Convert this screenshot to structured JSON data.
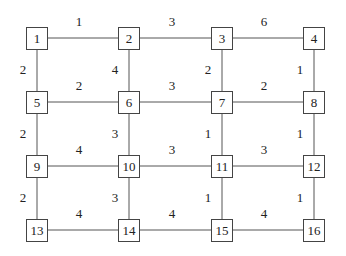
{
  "diagram": {
    "type": "weighted-grid-graph",
    "nodes": [
      {
        "id": "1",
        "x": 37,
        "y": 38
      },
      {
        "id": "2",
        "x": 129,
        "y": 38
      },
      {
        "id": "3",
        "x": 222,
        "y": 38
      },
      {
        "id": "4",
        "x": 314,
        "y": 38
      },
      {
        "id": "5",
        "x": 37,
        "y": 102
      },
      {
        "id": "6",
        "x": 129,
        "y": 102
      },
      {
        "id": "7",
        "x": 222,
        "y": 102
      },
      {
        "id": "8",
        "x": 314,
        "y": 102
      },
      {
        "id": "9",
        "x": 37,
        "y": 166
      },
      {
        "id": "10",
        "x": 129,
        "y": 166
      },
      {
        "id": "11",
        "x": 222,
        "y": 166
      },
      {
        "id": "12",
        "x": 314,
        "y": 166
      },
      {
        "id": "13",
        "x": 37,
        "y": 230
      },
      {
        "id": "14",
        "x": 129,
        "y": 230
      },
      {
        "id": "15",
        "x": 222,
        "y": 230
      },
      {
        "id": "16",
        "x": 314,
        "y": 230
      }
    ],
    "edges": [
      {
        "from": "1",
        "to": "2",
        "weight": "1",
        "lx": 79,
        "ly": 22
      },
      {
        "from": "2",
        "to": "3",
        "weight": "3",
        "lx": 172,
        "ly": 22
      },
      {
        "from": "3",
        "to": "4",
        "weight": "6",
        "lx": 264,
        "ly": 22
      },
      {
        "from": "5",
        "to": "6",
        "weight": "2",
        "lx": 79,
        "ly": 86
      },
      {
        "from": "6",
        "to": "7",
        "weight": "3",
        "lx": 172,
        "ly": 86
      },
      {
        "from": "7",
        "to": "8",
        "weight": "2",
        "lx": 264,
        "ly": 86
      },
      {
        "from": "9",
        "to": "10",
        "weight": "4",
        "lx": 79,
        "ly": 150
      },
      {
        "from": "10",
        "to": "11",
        "weight": "3",
        "lx": 172,
        "ly": 150
      },
      {
        "from": "11",
        "to": "12",
        "weight": "3",
        "lx": 264,
        "ly": 150
      },
      {
        "from": "13",
        "to": "14",
        "weight": "4",
        "lx": 79,
        "ly": 214
      },
      {
        "from": "14",
        "to": "15",
        "weight": "4",
        "lx": 172,
        "ly": 214
      },
      {
        "from": "15",
        "to": "16",
        "weight": "4",
        "lx": 264,
        "ly": 214
      },
      {
        "from": "1",
        "to": "5",
        "weight": "2",
        "lx": 23,
        "ly": 70
      },
      {
        "from": "2",
        "to": "6",
        "weight": "4",
        "lx": 115,
        "ly": 70
      },
      {
        "from": "3",
        "to": "7",
        "weight": "2",
        "lx": 208,
        "ly": 70
      },
      {
        "from": "4",
        "to": "8",
        "weight": "1",
        "lx": 300,
        "ly": 70
      },
      {
        "from": "5",
        "to": "9",
        "weight": "2",
        "lx": 23,
        "ly": 134
      },
      {
        "from": "6",
        "to": "10",
        "weight": "3",
        "lx": 115,
        "ly": 134
      },
      {
        "from": "7",
        "to": "11",
        "weight": "1",
        "lx": 208,
        "ly": 134
      },
      {
        "from": "8",
        "to": "12",
        "weight": "1",
        "lx": 300,
        "ly": 134
      },
      {
        "from": "9",
        "to": "13",
        "weight": "2",
        "lx": 23,
        "ly": 198
      },
      {
        "from": "10",
        "to": "14",
        "weight": "3",
        "lx": 115,
        "ly": 198
      },
      {
        "from": "11",
        "to": "15",
        "weight": "1",
        "lx": 208,
        "ly": 198
      },
      {
        "from": "12",
        "to": "16",
        "weight": "1",
        "lx": 300,
        "ly": 198
      }
    ]
  },
  "colors": {
    "line": "#555555",
    "border": "#444444",
    "text": "#222222",
    "background": "#ffffff"
  }
}
